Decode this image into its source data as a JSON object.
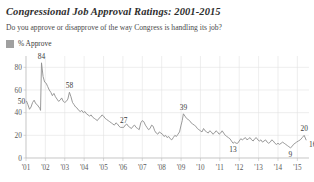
{
  "header": {
    "title": "Congressional Job Approval Ratings: 2001-2015",
    "subtitle": "Do you approve or disapprove of the way Congress is handling its job?"
  },
  "legend": {
    "swatch_name": "percent-approve-swatch",
    "label": "% Approve",
    "color": "#a0a0a0"
  },
  "chart_data": {
    "type": "line",
    "title": "Congressional Job Approval Ratings: 2001-2015",
    "subtitle": "Do you approve or disapprove of the way Congress is handling its job?",
    "xlabel": "",
    "ylabel": "",
    "ylim": [
      0,
      90
    ],
    "yticks": [
      0,
      20,
      40,
      60,
      80
    ],
    "ytick_labels": [
      "0",
      "20",
      "40",
      "60",
      "80"
    ],
    "xlim": [
      2001.0,
      2015.6
    ],
    "xticks": [
      2001,
      2002,
      2003,
      2004,
      2005,
      2006,
      2007,
      2008,
      2009,
      2010,
      2011,
      2012,
      2013,
      2014,
      2015
    ],
    "xtick_labels": [
      "'01",
      "'02",
      "'03",
      "'04",
      "'05",
      "'06",
      "'07",
      "'08",
      "'09",
      "'10",
      "'11",
      "'12",
      "'13",
      "'14",
      "'15"
    ],
    "grid": true,
    "legend_position": "top-left",
    "series": [
      {
        "name": "% Approve",
        "color": "#8e8e8e",
        "x": [
          2001.03,
          2001.1,
          2001.18,
          2001.26,
          2001.34,
          2001.42,
          2001.5,
          2001.58,
          2001.66,
          2001.71,
          2001.75,
          2001.8,
          2001.88,
          2001.96,
          2002.04,
          2002.12,
          2002.2,
          2002.28,
          2002.36,
          2002.44,
          2002.52,
          2002.6,
          2002.68,
          2002.76,
          2002.84,
          2002.92,
          2003.0,
          2003.08,
          2003.16,
          2003.24,
          2003.32,
          2003.4,
          2003.48,
          2003.56,
          2003.64,
          2003.72,
          2003.8,
          2003.88,
          2003.96,
          2004.04,
          2004.12,
          2004.2,
          2004.28,
          2004.36,
          2004.44,
          2004.52,
          2004.6,
          2004.68,
          2004.76,
          2004.84,
          2004.92,
          2005.0,
          2005.08,
          2005.16,
          2005.24,
          2005.32,
          2005.4,
          2005.48,
          2005.56,
          2005.64,
          2005.72,
          2005.8,
          2005.88,
          2005.96,
          2006.04,
          2006.12,
          2006.2,
          2006.28,
          2006.36,
          2006.44,
          2006.52,
          2006.6,
          2006.68,
          2006.76,
          2006.84,
          2006.92,
          2007.0,
          2007.08,
          2007.16,
          2007.24,
          2007.32,
          2007.4,
          2007.48,
          2007.56,
          2007.64,
          2007.72,
          2007.8,
          2007.88,
          2007.96,
          2008.04,
          2008.12,
          2008.2,
          2008.28,
          2008.36,
          2008.44,
          2008.52,
          2008.6,
          2008.68,
          2008.76,
          2008.84,
          2008.92,
          2009.0,
          2009.06,
          2009.12,
          2009.2,
          2009.28,
          2009.36,
          2009.44,
          2009.52,
          2009.6,
          2009.68,
          2009.76,
          2009.84,
          2009.92,
          2010.0,
          2010.08,
          2010.16,
          2010.24,
          2010.32,
          2010.4,
          2010.48,
          2010.56,
          2010.64,
          2010.72,
          2010.8,
          2010.88,
          2010.96,
          2011.04,
          2011.12,
          2011.2,
          2011.28,
          2011.36,
          2011.44,
          2011.52,
          2011.6,
          2011.68,
          2011.76,
          2011.84,
          2011.92,
          2012.0,
          2012.08,
          2012.16,
          2012.24,
          2012.32,
          2012.4,
          2012.48,
          2012.56,
          2012.64,
          2012.72,
          2012.8,
          2012.88,
          2012.96,
          2013.04,
          2013.12,
          2013.2,
          2013.28,
          2013.36,
          2013.44,
          2013.52,
          2013.6,
          2013.68,
          2013.76,
          2013.84,
          2013.92,
          2014.0,
          2014.08,
          2014.16,
          2014.24,
          2014.32,
          2014.4,
          2014.48,
          2014.56,
          2014.64,
          2014.72,
          2014.8,
          2014.88,
          2014.96,
          2015.05,
          2015.15,
          2015.25,
          2015.35,
          2015.45
        ],
        "values": [
          50,
          47,
          43,
          45,
          49,
          51,
          48,
          47,
          45,
          44,
          42,
          84,
          72,
          67,
          66,
          63,
          60,
          58,
          55,
          57,
          54,
          52,
          50,
          51,
          53,
          50,
          49,
          50,
          52,
          58,
          54,
          49,
          47,
          45,
          44,
          42,
          41,
          42,
          40,
          41,
          39,
          38,
          37,
          38,
          36,
          35,
          34,
          33,
          35,
          36,
          38,
          37,
          35,
          34,
          33,
          32,
          31,
          30,
          29,
          31,
          30,
          28,
          27,
          27,
          27,
          29,
          30,
          28,
          27,
          26,
          28,
          29,
          27,
          26,
          25,
          31,
          33,
          32,
          29,
          27,
          25,
          26,
          29,
          28,
          24,
          22,
          21,
          23,
          22,
          21,
          19,
          20,
          18,
          19,
          17,
          16,
          18,
          20,
          19,
          21,
          23,
          29,
          33,
          39,
          37,
          35,
          34,
          33,
          31,
          30,
          29,
          28,
          26,
          25,
          24,
          23,
          26,
          24,
          23,
          22,
          24,
          23,
          21,
          22,
          24,
          23,
          21,
          22,
          24,
          22,
          20,
          19,
          18,
          17,
          15,
          13,
          14,
          13,
          13,
          15,
          17,
          16,
          17,
          18,
          16,
          17,
          18,
          16,
          15,
          17,
          18,
          16,
          15,
          16,
          14,
          15,
          16,
          14,
          13,
          14,
          16,
          15,
          13,
          12,
          13,
          12,
          13,
          14,
          13,
          12,
          11,
          10,
          9,
          10,
          12,
          13,
          14,
          15,
          16,
          18,
          20,
          16
        ]
      }
    ],
    "point_labels": [
      {
        "name": "label-50",
        "text": "50",
        "x": 2001.03,
        "y": 50,
        "pos": "left"
      },
      {
        "name": "label-84",
        "text": "84",
        "x": 2001.8,
        "y": 84,
        "pos": "above"
      },
      {
        "name": "label-58",
        "text": "58",
        "x": 2003.24,
        "y": 58,
        "pos": "above"
      },
      {
        "name": "label-27",
        "text": "27",
        "x": 2006.04,
        "y": 27,
        "pos": "above"
      },
      {
        "name": "label-39",
        "text": "39",
        "x": 2009.12,
        "y": 39,
        "pos": "above"
      },
      {
        "name": "label-13",
        "text": "13",
        "x": 2011.68,
        "y": 13,
        "pos": "below"
      },
      {
        "name": "label-9",
        "text": "9",
        "x": 2014.64,
        "y": 9,
        "pos": "below"
      },
      {
        "name": "label-20",
        "text": "20",
        "x": 2015.35,
        "y": 20,
        "pos": "above"
      },
      {
        "name": "label-16",
        "text": "16",
        "x": 2015.45,
        "y": 16,
        "pos": "below-right"
      }
    ]
  }
}
